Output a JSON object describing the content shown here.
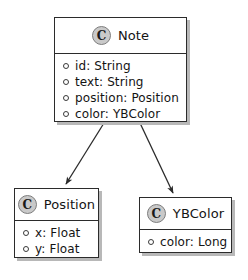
{
  "diagram": {
    "type": "uml-class-diagram",
    "background_color": "#ffffff",
    "line_color": "#2b2b2b",
    "shadow_color": "#b8b8b8",
    "icon_fill_color": "#c9c9c9",
    "icon_border_color": "#7d7d7d",
    "classes": [
      {
        "id": "note",
        "name": "Note",
        "icon": "class-circle-c-icon",
        "icon_letter": "C",
        "attributes": [
          {
            "marker": "public-visibility-icon",
            "text": "id: String"
          },
          {
            "marker": "public-visibility-icon",
            "text": "text: String"
          },
          {
            "marker": "public-visibility-icon",
            "text": "position: Position"
          },
          {
            "marker": "public-visibility-icon",
            "text": "color: YBColor"
          }
        ]
      },
      {
        "id": "position",
        "name": "Position",
        "icon": "class-circle-c-icon",
        "icon_letter": "C",
        "attributes": [
          {
            "marker": "public-visibility-icon",
            "text": "x: Float"
          },
          {
            "marker": "public-visibility-icon",
            "text": "y: Float"
          }
        ]
      },
      {
        "id": "ybcolor",
        "name": "YBColor",
        "icon": "class-circle-c-icon",
        "icon_letter": "C",
        "attributes": [
          {
            "marker": "public-visibility-icon",
            "text": "color: Long"
          }
        ]
      }
    ],
    "connectors": [
      {
        "id": "note-to-position",
        "kind": "directed-association-arrow",
        "from": "note",
        "to": "position",
        "label": ""
      },
      {
        "id": "note-to-ybcolor",
        "kind": "directed-association-arrow",
        "from": "note",
        "to": "ybcolor",
        "label": ""
      }
    ]
  }
}
